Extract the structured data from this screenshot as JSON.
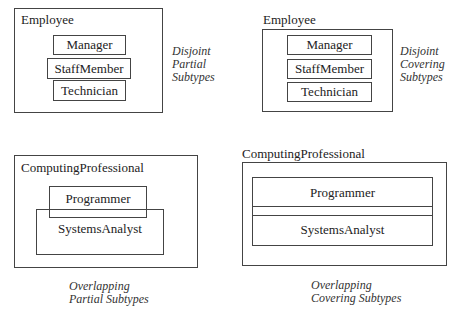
{
  "diagrams": [
    {
      "supertype": "Employee",
      "subtypes": [
        "Manager",
        "StaffMember",
        "Technician"
      ],
      "caption": [
        "Disjoint",
        "Partial",
        "Subtypes"
      ]
    },
    {
      "supertype": "Employee",
      "subtypes": [
        "Manager",
        "StaffMember",
        "Technician"
      ],
      "caption": [
        "Disjoint",
        "Covering",
        "Subtypes"
      ]
    },
    {
      "supertype": "ComputingProfessional",
      "subtypes": [
        "Programmer",
        "SystemsAnalyst"
      ],
      "caption": [
        "Overlapping",
        "Partial Subtypes"
      ]
    },
    {
      "supertype": "ComputingProfessional",
      "subtypes": [
        "Programmer",
        "SystemsAnalyst"
      ],
      "caption": [
        "Overlapping",
        "Covering Subtypes"
      ]
    }
  ]
}
